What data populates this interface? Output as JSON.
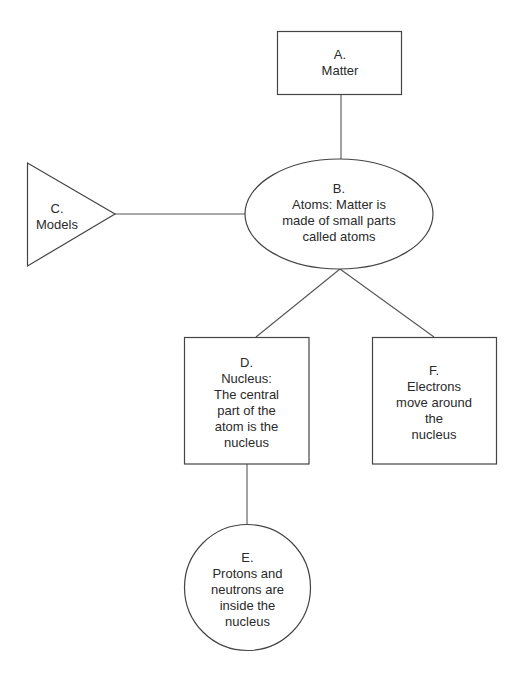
{
  "diagram": {
    "type": "concept-map",
    "nodes": [
      {
        "id": "A",
        "shape": "rectangle",
        "lines": [
          "A.",
          "Matter"
        ]
      },
      {
        "id": "B",
        "shape": "ellipse",
        "lines": [
          "B.",
          "Atoms: Matter is",
          "made of small parts",
          "called atoms"
        ]
      },
      {
        "id": "C",
        "shape": "triangle",
        "lines": [
          "C.",
          "Models"
        ]
      },
      {
        "id": "D",
        "shape": "rectangle",
        "lines": [
          "D.",
          "Nucleus:",
          "The central",
          "part of the",
          "atom is the",
          "nucleus"
        ]
      },
      {
        "id": "E",
        "shape": "circle",
        "lines": [
          "E.",
          "Protons and",
          "neutrons are",
          "inside the",
          "nucleus"
        ]
      },
      {
        "id": "F",
        "shape": "rectangle",
        "lines": [
          "F.",
          "Electrons",
          "move around",
          "the",
          "nucleus"
        ]
      }
    ],
    "edges": [
      {
        "from": "A",
        "to": "B"
      },
      {
        "from": "C",
        "to": "B"
      },
      {
        "from": "B",
        "to": "D"
      },
      {
        "from": "B",
        "to": "F"
      },
      {
        "from": "D",
        "to": "E"
      }
    ],
    "colors": {
      "stroke": "#444444",
      "text": "#2a2a2a",
      "background": "#ffffff"
    }
  }
}
